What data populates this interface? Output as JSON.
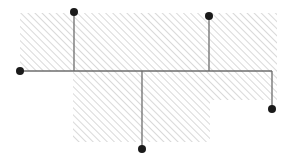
{
  "diagram": {
    "type": "tree-network",
    "background": "#ffffff",
    "hatch_color": "#bdbdbd",
    "line_color": "#6e6e6e",
    "node_color": "#1a1a1a",
    "hatched_region": {
      "polygon": [
        [
          20,
          13
        ],
        [
          277,
          13
        ],
        [
          277,
          100
        ],
        [
          210,
          100
        ],
        [
          210,
          142
        ],
        [
          73,
          142
        ],
        [
          73,
          71
        ],
        [
          20,
          71
        ]
      ]
    },
    "trunk": {
      "x1": 20,
      "y1": 71,
      "x2": 272,
      "y2": 71
    },
    "branches": [
      {
        "x1": 74,
        "y1": 12,
        "x2": 74,
        "y2": 71
      },
      {
        "x1": 209,
        "y1": 16,
        "x2": 209,
        "y2": 71
      },
      {
        "x1": 142,
        "y1": 71,
        "x2": 142,
        "y2": 149
      },
      {
        "x1": 272,
        "y1": 71,
        "x2": 272,
        "y2": 109
      }
    ],
    "nodes": [
      {
        "id": "node-left",
        "cx": 20,
        "cy": 71
      },
      {
        "id": "node-top-left",
        "cx": 74,
        "cy": 12
      },
      {
        "id": "node-top-right",
        "cx": 209,
        "cy": 16
      },
      {
        "id": "node-bottom",
        "cx": 142,
        "cy": 149
      },
      {
        "id": "node-right",
        "cx": 272,
        "cy": 109
      }
    ]
  }
}
